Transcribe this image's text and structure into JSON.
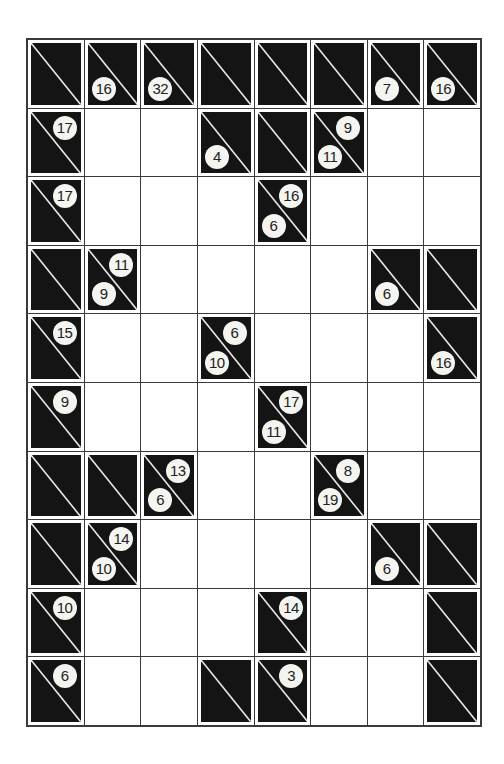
{
  "puzzle": {
    "type": "kakuro",
    "rows": 10,
    "cols": 8,
    "colors": {
      "block": "#141414",
      "white": "#ffffff",
      "grid_line": "#3a3a3a",
      "clue_disc": "#f4f4f0"
    },
    "grid": [
      [
        {
          "type": "block",
          "down": null,
          "across": null
        },
        {
          "type": "block",
          "down": "16",
          "across": null
        },
        {
          "type": "block",
          "down": "32",
          "across": null
        },
        {
          "type": "block",
          "down": null,
          "across": null
        },
        {
          "type": "block",
          "down": null,
          "across": null
        },
        {
          "type": "block",
          "down": null,
          "across": null
        },
        {
          "type": "block",
          "down": "7",
          "across": null
        },
        {
          "type": "block",
          "down": "16",
          "across": null
        }
      ],
      [
        {
          "type": "block",
          "down": null,
          "across": "17"
        },
        {
          "type": "white"
        },
        {
          "type": "white"
        },
        {
          "type": "block",
          "down": "4",
          "across": null
        },
        {
          "type": "block",
          "down": null,
          "across": null
        },
        {
          "type": "block",
          "down": "11",
          "across": "9"
        },
        {
          "type": "white"
        },
        {
          "type": "white"
        }
      ],
      [
        {
          "type": "block",
          "down": null,
          "across": "17"
        },
        {
          "type": "white"
        },
        {
          "type": "white"
        },
        {
          "type": "white"
        },
        {
          "type": "block",
          "down": "6",
          "across": "16"
        },
        {
          "type": "white"
        },
        {
          "type": "white"
        },
        {
          "type": "white"
        }
      ],
      [
        {
          "type": "block",
          "down": null,
          "across": null
        },
        {
          "type": "block",
          "down": "9",
          "across": "11"
        },
        {
          "type": "white"
        },
        {
          "type": "white"
        },
        {
          "type": "white"
        },
        {
          "type": "white"
        },
        {
          "type": "block",
          "down": "6",
          "across": null
        },
        {
          "type": "block",
          "down": null,
          "across": null
        }
      ],
      [
        {
          "type": "block",
          "down": null,
          "across": "15"
        },
        {
          "type": "white"
        },
        {
          "type": "white"
        },
        {
          "type": "block",
          "down": "10",
          "across": "6"
        },
        {
          "type": "white"
        },
        {
          "type": "white"
        },
        {
          "type": "white"
        },
        {
          "type": "block",
          "down": "16",
          "across": null
        }
      ],
      [
        {
          "type": "block",
          "down": null,
          "across": "9"
        },
        {
          "type": "white"
        },
        {
          "type": "white"
        },
        {
          "type": "white"
        },
        {
          "type": "block",
          "down": "11",
          "across": "17"
        },
        {
          "type": "white"
        },
        {
          "type": "white"
        },
        {
          "type": "white"
        }
      ],
      [
        {
          "type": "block",
          "down": null,
          "across": null
        },
        {
          "type": "block",
          "down": null,
          "across": null
        },
        {
          "type": "block",
          "down": "6",
          "across": "13"
        },
        {
          "type": "white"
        },
        {
          "type": "white"
        },
        {
          "type": "block",
          "down": "19",
          "across": "8"
        },
        {
          "type": "white"
        },
        {
          "type": "white"
        }
      ],
      [
        {
          "type": "block",
          "down": null,
          "across": null
        },
        {
          "type": "block",
          "down": "10",
          "across": "14"
        },
        {
          "type": "white"
        },
        {
          "type": "white"
        },
        {
          "type": "white"
        },
        {
          "type": "white"
        },
        {
          "type": "block",
          "down": "6",
          "across": null
        },
        {
          "type": "block",
          "down": null,
          "across": null
        }
      ],
      [
        {
          "type": "block",
          "down": null,
          "across": "10"
        },
        {
          "type": "white"
        },
        {
          "type": "white"
        },
        {
          "type": "white"
        },
        {
          "type": "block",
          "down": null,
          "across": "14"
        },
        {
          "type": "white"
        },
        {
          "type": "white"
        },
        {
          "type": "block",
          "down": null,
          "across": null
        }
      ],
      [
        {
          "type": "block",
          "down": null,
          "across": "6"
        },
        {
          "type": "white"
        },
        {
          "type": "white"
        },
        {
          "type": "block",
          "down": null,
          "across": null
        },
        {
          "type": "block",
          "down": null,
          "across": "3"
        },
        {
          "type": "white"
        },
        {
          "type": "white"
        },
        {
          "type": "block",
          "down": null,
          "across": null
        }
      ]
    ]
  }
}
